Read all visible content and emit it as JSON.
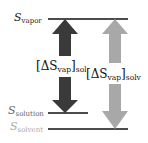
{
  "diagram": {
    "levels": [
      {
        "id": "vapor",
        "symbol": "S",
        "subscript": "vapor",
        "color": "#222222"
      },
      {
        "id": "solution",
        "symbol": "S",
        "subscript": "solution",
        "color": "#666666"
      },
      {
        "id": "solvent",
        "symbol": "S",
        "subscript": "solvent",
        "color": "#aaaaaa"
      }
    ],
    "arrows": [
      {
        "id": "soln",
        "label_prefix": "[ΔS",
        "label_sub1": "vap",
        "label_close": "]",
        "label_sub2": "soln",
        "color": "#3a3a3a"
      },
      {
        "id": "solv",
        "label_prefix": "[ΔS",
        "label_sub1": "vap",
        "label_close": "]",
        "label_sub2": "solv",
        "color": "#a8a8a8"
      }
    ]
  }
}
